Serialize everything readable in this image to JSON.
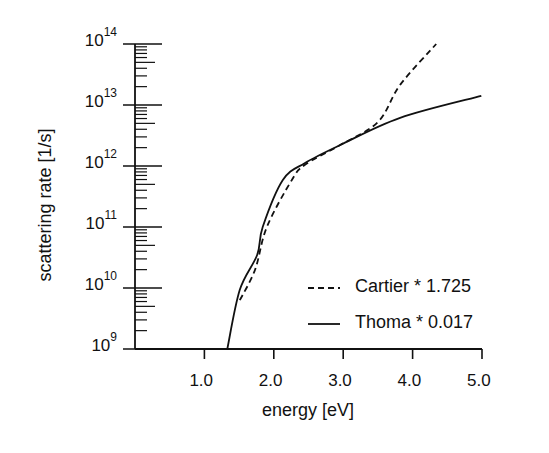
{
  "chart_data": {
    "type": "line",
    "title": "",
    "xlabel": "energy [eV]",
    "ylabel": "scattering rate [1/s]",
    "xlim": [
      0,
      5.0
    ],
    "ylim": [
      1000000000.0,
      100000000000000.0
    ],
    "yscale": "log",
    "grid": false,
    "legend_position": "lower right",
    "x_ticks": [
      "1.0",
      "2.0",
      "3.0",
      "4.0",
      "5.0"
    ],
    "y_ticks": [
      {
        "base": "10",
        "exp": "9"
      },
      {
        "base": "10",
        "exp": "10"
      },
      {
        "base": "10",
        "exp": "11"
      },
      {
        "base": "10",
        "exp": "12"
      },
      {
        "base": "10",
        "exp": "13"
      },
      {
        "base": "10",
        "exp": "14"
      }
    ],
    "series": [
      {
        "name": "Cartier * 1.725",
        "style": "dashed",
        "x": [
          1.51,
          1.73,
          1.9,
          2.26,
          2.45,
          2.95,
          3.5,
          3.82,
          4.34
        ],
        "log10_y": [
          9.8,
          10.3,
          11.0,
          11.77,
          12.02,
          12.34,
          12.72,
          13.33,
          14.0
        ]
      },
      {
        "name": "Thoma * 0.017",
        "style": "solid",
        "x": [
          1.33,
          1.51,
          1.76,
          1.84,
          2.13,
          2.45,
          2.95,
          3.82,
          4.99
        ],
        "log10_y": [
          9.0,
          9.97,
          10.54,
          11.0,
          11.77,
          12.05,
          12.34,
          12.79,
          13.15
        ]
      }
    ]
  },
  "legend": {
    "items": [
      {
        "label": "Cartier * 1.725",
        "style": "dashed"
      },
      {
        "label": "Thoma * 0.017",
        "style": "solid"
      }
    ]
  },
  "colors": {
    "line": "#111111",
    "background": "#ffffff"
  }
}
